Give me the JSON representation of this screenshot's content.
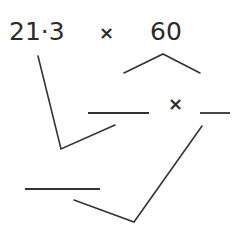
{
  "diagram": {
    "expression": {
      "left_operand": "21·3",
      "operator": "×",
      "right_operand": "60"
    },
    "second_row": {
      "operator": "×",
      "blanks": 2
    },
    "third_row": {
      "blanks": 1
    },
    "line_color": "#333333",
    "text_color": "#2b2b2b"
  }
}
